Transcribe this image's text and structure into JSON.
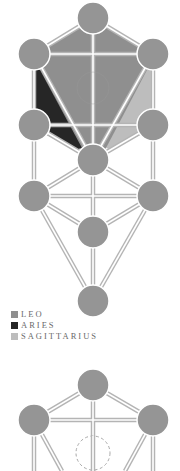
{
  "colors": {
    "background": "#ffffff",
    "sephirah": "#959595",
    "leo": "#8f8f8f",
    "aries": "#262626",
    "sagittarius": "#bdbdbd",
    "path_outline": "#b4b4b4",
    "path_inner": "#ffffff",
    "daath_dash": "#a8a8a8"
  },
  "legend": {
    "items": [
      {
        "label": "LEO",
        "color": "#8f8f8f"
      },
      {
        "label": "ARIES",
        "color": "#262626"
      },
      {
        "label": "SAGITTARIUS",
        "color": "#bdbdbd"
      }
    ]
  },
  "diagrams": [
    {
      "name": "tree-of-life-fire-signs",
      "sephiroth": [
        {
          "id": "kether",
          "cx": 93,
          "cy": 18
        },
        {
          "id": "binah",
          "cx": 34,
          "cy": 54
        },
        {
          "id": "chokmah",
          "cx": 153,
          "cy": 54
        },
        {
          "id": "geburah",
          "cx": 34,
          "cy": 125
        },
        {
          "id": "chesed",
          "cx": 153,
          "cy": 125
        },
        {
          "id": "tiphareth",
          "cx": 93,
          "cy": 160
        },
        {
          "id": "hod",
          "cx": 34,
          "cy": 196
        },
        {
          "id": "netzach",
          "cx": 153,
          "cy": 196
        },
        {
          "id": "yesod",
          "cx": 93,
          "cy": 232
        },
        {
          "id": "malkuth",
          "cx": 93,
          "cy": 301
        }
      ],
      "daath": {
        "cx": 93,
        "cy": 88,
        "visible": "faint"
      }
    },
    {
      "name": "tree-of-life-partial",
      "sephiroth": [
        {
          "id": "kether",
          "cx": 93,
          "cy": 385
        },
        {
          "id": "binah",
          "cx": 34,
          "cy": 420
        },
        {
          "id": "chokmah",
          "cx": 153,
          "cy": 420
        }
      ],
      "daath": {
        "cx": 93,
        "cy": 453,
        "visible": "dashed"
      }
    }
  ]
}
